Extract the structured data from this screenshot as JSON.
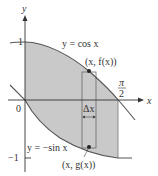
{
  "diagram": {
    "axes": {
      "x_label": "x",
      "y_label": "y",
      "origin_label": "0",
      "y_tick_top": "1",
      "y_tick_bottom": "−1",
      "x_tick_num": "π",
      "x_tick_den": "2"
    },
    "curves": {
      "upper": {
        "label": "y = cos x",
        "point_label": "(x, f(x))"
      },
      "lower": {
        "label": "y = −sin x",
        "point_label": "(x, g(x))"
      }
    },
    "strip": {
      "width_label": "Δx"
    },
    "colors": {
      "fill": "#c9c9c9",
      "curve": "#555555",
      "axis": "#333333",
      "strip": "#666666",
      "point": "#222222"
    }
  }
}
